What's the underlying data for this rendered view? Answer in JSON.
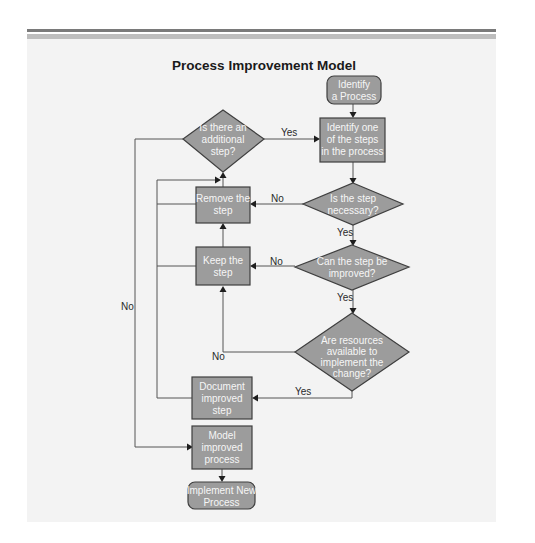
{
  "diagram": {
    "title": "Process Improvement Model",
    "nodes": {
      "start": {
        "type": "terminator",
        "lines": [
          "Identify",
          "a Process"
        ]
      },
      "identify_step": {
        "type": "process",
        "lines": [
          "Identify one",
          "of the steps",
          "in the process"
        ]
      },
      "additional_step": {
        "type": "decision",
        "lines": [
          "Is there an",
          "additional",
          "step?"
        ]
      },
      "necessary": {
        "type": "decision",
        "lines": [
          "Is the step",
          "necessary?"
        ]
      },
      "remove": {
        "type": "process",
        "lines": [
          "Remove the",
          "step"
        ]
      },
      "improvable": {
        "type": "decision",
        "lines": [
          "Can the step be",
          "improved?"
        ]
      },
      "keep": {
        "type": "process",
        "lines": [
          "Keep the",
          "step"
        ]
      },
      "resources": {
        "type": "decision",
        "lines": [
          "Are resources",
          "available to",
          "implement the",
          "change?"
        ]
      },
      "document": {
        "type": "process",
        "lines": [
          "Document",
          "improved",
          "step"
        ]
      },
      "model": {
        "type": "process",
        "lines": [
          "Model",
          "improved",
          "process"
        ]
      },
      "end": {
        "type": "terminator",
        "lines": [
          "Implement New",
          "Process"
        ]
      }
    },
    "edge_labels": {
      "additional_yes": "Yes",
      "additional_no": "No",
      "necessary_no": "No",
      "necessary_yes": "Yes",
      "improvable_no": "No",
      "improvable_yes": "Yes",
      "resources_no": "No",
      "resources_yes": "Yes"
    },
    "colors": {
      "shape_fill": "#9c9c9c",
      "shape_stroke": "#3f3f3f",
      "shape_text": "#f6f6f6",
      "panel_bg": "#f3f3f3",
      "rule_dark": "#7a7a7a",
      "rule_light": "#bdbdbd"
    }
  }
}
